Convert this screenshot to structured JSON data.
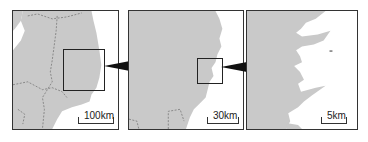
{
  "figure": {
    "panels": [
      {
        "id": "left",
        "scale_label": "100km"
      },
      {
        "id": "middle",
        "scale_label": "30km"
      },
      {
        "id": "right",
        "scale_label": "5km"
      }
    ],
    "colors": {
      "land": "#c9c9c9",
      "sea": "#ffffff",
      "border": "#333333",
      "boundary_line": "#777777",
      "pointer": "#111111"
    }
  }
}
